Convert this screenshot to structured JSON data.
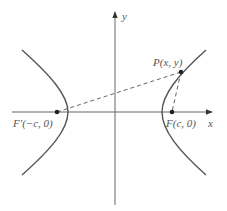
{
  "figure": {
    "axes": {
      "x_label": "x",
      "y_label": "y"
    },
    "point_P": {
      "label": "P(x, y)"
    },
    "focus_right": {
      "label": "F(c, 0)"
    },
    "focus_left": {
      "label": "F′(−c, 0)"
    },
    "colors": {
      "curve": "#555555",
      "axis": "#666666",
      "dashed": "#666666",
      "point": "#222222"
    }
  }
}
